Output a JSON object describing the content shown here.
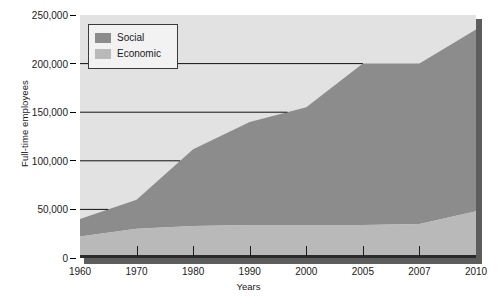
{
  "chart_data": {
    "type": "area",
    "title": "",
    "xlabel": "Years",
    "ylabel": "Full-time employees",
    "categories": [
      "1960",
      "1970",
      "1980",
      "1990",
      "2000",
      "2005",
      "2007",
      "2010"
    ],
    "stacked": true,
    "series": [
      {
        "name": "Economic",
        "color": "#b9b9b9",
        "values": [
          22000,
          30000,
          33000,
          34000,
          34000,
          34000,
          35000,
          48000
        ]
      },
      {
        "name": "Social",
        "color": "#8c8c8c",
        "values": [
          18000,
          30000,
          79000,
          106000,
          121000,
          166000,
          165000,
          187000
        ]
      }
    ],
    "totals": [
      40000,
      60000,
      112000,
      140000,
      155000,
      200000,
      200000,
      235000
    ],
    "ylim": [
      0,
      250000
    ],
    "yticks": [
      "0",
      "50,000",
      "100,000",
      "150,000",
      "200,000",
      "250,000"
    ],
    "ytick_values": [
      0,
      50000,
      100000,
      150000,
      200000,
      250000
    ],
    "grid": true,
    "legend_position": "top-left",
    "plot_background": "#e2e2e2"
  },
  "legend": {
    "items": [
      {
        "label": "Social",
        "color": "#8c8c8c"
      },
      {
        "label": "Economic",
        "color": "#b9b9b9"
      }
    ]
  }
}
